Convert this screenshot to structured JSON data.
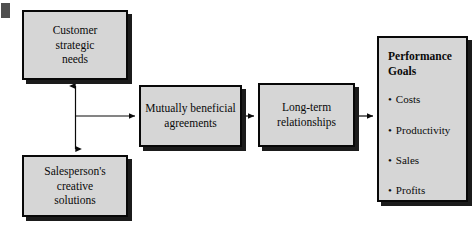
{
  "diagram": {
    "background_color": "#ffffff",
    "node_fill_color": "#d6d6d6",
    "node_border_color": "#080808",
    "shadow_color": "#1b1b1b",
    "nodes": {
      "customer": {
        "name": "Customer strategic needs",
        "lines": [
          "Customer",
          "strategic",
          "needs"
        ]
      },
      "salesperson": {
        "name": "Salesperson's creative solutions",
        "lines": [
          "Salesperson's",
          "creative",
          "solutions"
        ]
      },
      "agreements": {
        "name": "Mutually beneficial agreements",
        "lines": [
          "Mutually beneficial",
          "agreements"
        ]
      },
      "relationships": {
        "name": "Long-term relationships",
        "lines": [
          "Long-term",
          "relationships"
        ]
      },
      "goals": {
        "name": "Performance Goals",
        "title_lines": [
          "Performance",
          "Goals"
        ],
        "bullets": [
          "Costs",
          "Productivity",
          "Sales",
          "Profits"
        ]
      }
    },
    "connectors": [
      {
        "name": "customer-salesperson-vertical",
        "from": "salesperson",
        "to": "customer",
        "style": "double-headed-vertical"
      },
      {
        "name": "junction-to-agreements",
        "from": "junction",
        "to": "agreements",
        "style": "single-arrow-right"
      },
      {
        "name": "agreements-to-relationships",
        "from": "agreements",
        "to": "relationships",
        "style": "single-arrow-right"
      },
      {
        "name": "relationships-to-goals",
        "from": "relationships",
        "to": "goals",
        "style": "single-arrow-right"
      }
    ]
  }
}
